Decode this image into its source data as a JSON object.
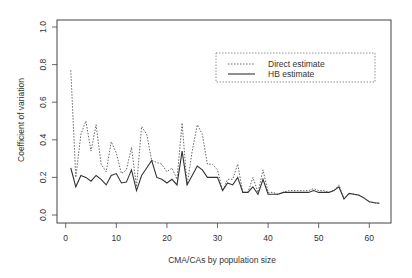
{
  "chart_data": {
    "type": "line",
    "title": "",
    "xlabel": "CMA/CAs by population size",
    "ylabel": "Coefficient of variation",
    "xlim": [
      -2,
      64
    ],
    "ylim": [
      0,
      1.0
    ],
    "xticks": [
      0,
      10,
      20,
      30,
      40,
      50,
      60
    ],
    "yticks": [
      "0.0",
      "0.2",
      "0.4",
      "0.6",
      "0.8",
      "1.0"
    ],
    "grid": false,
    "legend_position": "upper right",
    "x": [
      1,
      2,
      3,
      4,
      5,
      6,
      7,
      8,
      9,
      10,
      11,
      12,
      13,
      14,
      15,
      16,
      17,
      18,
      19,
      20,
      21,
      22,
      23,
      24,
      25,
      26,
      27,
      28,
      29,
      30,
      31,
      32,
      33,
      34,
      35,
      36,
      37,
      38,
      39,
      40,
      41,
      42,
      43,
      44,
      45,
      46,
      47,
      48,
      49,
      50,
      51,
      52,
      53,
      54,
      55,
      56,
      57,
      58,
      59,
      60,
      61,
      62
    ],
    "series": [
      {
        "name": "Direct estimate",
        "style": "dotted",
        "values": [
          0.77,
          0.2,
          0.43,
          0.5,
          0.34,
          0.48,
          0.27,
          0.23,
          0.39,
          0.33,
          0.22,
          0.24,
          0.36,
          0.15,
          0.47,
          0.43,
          0.29,
          0.28,
          0.27,
          0.23,
          0.25,
          0.19,
          0.49,
          0.16,
          0.34,
          0.48,
          0.43,
          0.27,
          0.27,
          0.24,
          0.13,
          0.19,
          0.19,
          0.27,
          0.12,
          0.12,
          0.2,
          0.12,
          0.24,
          0.12,
          0.12,
          0.11,
          0.12,
          0.13,
          0.13,
          0.13,
          0.13,
          0.13,
          0.14,
          0.13,
          0.13,
          0.12,
          0.13,
          0.16,
          0.085,
          0.115,
          0.11,
          0.105,
          0.09,
          0.07,
          0.065,
          0.062
        ]
      },
      {
        "name": "HB estimate",
        "style": "solid",
        "values": [
          0.25,
          0.15,
          0.21,
          0.2,
          0.18,
          0.21,
          0.19,
          0.16,
          0.21,
          0.22,
          0.17,
          0.175,
          0.24,
          0.13,
          0.21,
          0.25,
          0.29,
          0.2,
          0.19,
          0.17,
          0.19,
          0.16,
          0.34,
          0.16,
          0.21,
          0.26,
          0.24,
          0.2,
          0.2,
          0.2,
          0.13,
          0.17,
          0.16,
          0.2,
          0.12,
          0.12,
          0.15,
          0.11,
          0.19,
          0.11,
          0.11,
          0.11,
          0.12,
          0.12,
          0.12,
          0.12,
          0.12,
          0.12,
          0.13,
          0.12,
          0.12,
          0.12,
          0.13,
          0.15,
          0.085,
          0.115,
          0.11,
          0.105,
          0.09,
          0.07,
          0.065,
          0.062
        ]
      }
    ]
  },
  "legend": {
    "items": [
      {
        "label": "Direct estimate",
        "style": "dotted"
      },
      {
        "label": "HB estimate",
        "style": "solid"
      }
    ]
  },
  "colors": {
    "line": "#333333",
    "frame": "#444444",
    "dotted": "#666666"
  }
}
